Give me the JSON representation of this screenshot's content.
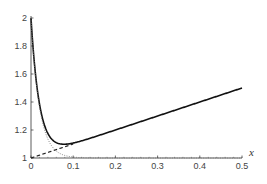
{
  "chart_data": {
    "type": "line",
    "title": "",
    "xlabel": "x",
    "ylabel": "",
    "xlim": [
      0,
      0.5
    ],
    "ylim": [
      1,
      2
    ],
    "grid": false,
    "legend": null,
    "x_ticks": [
      "0",
      "0.1",
      "0.2",
      "0.3",
      "0.4",
      "0.5"
    ],
    "y_ticks": [
      "1",
      "1.2",
      "1.4",
      "1.6",
      "1.8",
      "2"
    ],
    "series": [
      {
        "name": "composite solution (solid)",
        "style": "solid",
        "formula": "1 + x + exp(-x/0.02)",
        "x": [
          0,
          0.01,
          0.02,
          0.03,
          0.04,
          0.05,
          0.06,
          0.07,
          0.08,
          0.1,
          0.15,
          0.2,
          0.3,
          0.4,
          0.5
        ],
        "y": [
          2.0,
          1.617,
          1.388,
          1.253,
          1.175,
          1.132,
          1.11,
          1.1,
          1.098,
          1.107,
          1.15,
          1.2,
          1.3,
          1.4,
          1.5
        ]
      },
      {
        "name": "outer solution (dashed)",
        "style": "dashed",
        "formula": "1 + x",
        "x": [
          0,
          0.1
        ],
        "y": [
          1.0,
          1.1
        ]
      },
      {
        "name": "inner solution (dotted)",
        "style": "dotted",
        "formula": "1 + exp(-x/0.02)",
        "x": [
          0,
          0.01,
          0.02,
          0.03,
          0.04,
          0.06,
          0.08,
          0.1,
          0.5
        ],
        "y": [
          2.0,
          1.607,
          1.368,
          1.223,
          1.135,
          1.05,
          1.018,
          1.007,
          1.0
        ]
      }
    ]
  }
}
